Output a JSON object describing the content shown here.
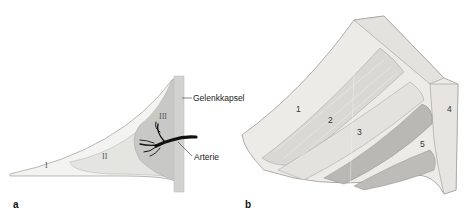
{
  "figure": {
    "panel_a": {
      "letter": "a",
      "zones": [
        {
          "label": "I",
          "color": "#f3f3f1"
        },
        {
          "label": "II",
          "color": "#e4e4e1"
        },
        {
          "label": "III",
          "color": "#c8c8c6"
        }
      ],
      "capsule_color": "#d2d2d0",
      "artery_color": "#111111",
      "annotations": {
        "capsule": "Gelenkkapsel",
        "artery": "Arterie"
      }
    },
    "panel_b": {
      "letter": "b",
      "layers": [
        "1",
        "2",
        "3",
        "4",
        "5"
      ],
      "colors": {
        "outer": "#ecebe8",
        "fibrous": "#d9d8d4",
        "band": "#e3e2df",
        "dark": "#b9b8b4",
        "edge": "#8e8d89"
      }
    }
  }
}
